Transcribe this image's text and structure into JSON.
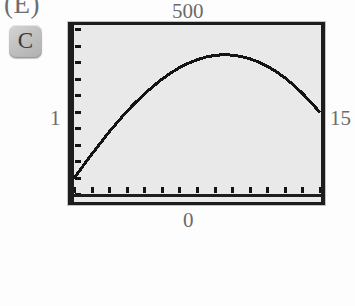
{
  "page": {
    "part_label": "(E)",
    "background_color": "#fdfdfd"
  },
  "calculator_key": {
    "name": "C",
    "label": "C",
    "face_color": "#c2c2c2",
    "text_color": "#3a3a3a"
  },
  "screen": {
    "background_color": "#e9e9e9",
    "border_color": "#1d1d1d",
    "trace_color": "#141414"
  },
  "window_labels": {
    "ymax": "500",
    "ymin": "0",
    "xmin": "1",
    "xmax": "15",
    "label_color": "#6a6a6a"
  },
  "chart_data": {
    "type": "line",
    "title": "",
    "subtitle": "",
    "xlabel": "",
    "ylabel": "",
    "grid": false,
    "legend": null,
    "xlim": [
      1,
      15
    ],
    "ylim": [
      0,
      500
    ],
    "xtick_labels": [
      "1",
      "15"
    ],
    "ytick_labels": [
      "0",
      "500"
    ],
    "xtick_count": 15,
    "ytick_count": 11,
    "xtick_step": 1,
    "ytick_step": 50,
    "annotations": [
      {
        "text": "500",
        "position": "top-center",
        "meaning": "Ymax"
      },
      {
        "text": "0",
        "position": "bottom-center",
        "meaning": "Ymin"
      },
      {
        "text": "1",
        "position": "left-middle",
        "meaning": "Xmin"
      },
      {
        "text": "15",
        "position": "right-middle",
        "meaning": "Xmax"
      }
    ],
    "series": [
      {
        "name": "curve",
        "color": "#141414",
        "x": [
          1,
          1.5,
          2,
          2.5,
          3,
          3.5,
          4,
          4.5,
          5,
          5.5,
          6,
          6.5,
          7,
          7.5,
          8,
          8.5,
          9,
          9.5,
          10,
          10.5,
          11,
          11.5,
          12,
          12.5,
          13,
          13.5,
          14,
          14.5,
          15
        ],
        "y": [
          48,
          84,
          120,
          154,
          188,
          219,
          250,
          277,
          303,
          326,
          348,
          366,
          383,
          396,
          407,
          415,
          420,
          422,
          421,
          417,
          410,
          400,
          387,
          371,
          352,
          330,
          305,
          277,
          247
        ]
      }
    ]
  }
}
